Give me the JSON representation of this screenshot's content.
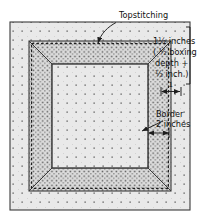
{
  "figure": {
    "title_label": "Topstitching",
    "annotations": {
      "topstitching": "Topstitching",
      "boxing_line1": "1½ inches",
      "boxing_line2": "( ½ boxing",
      "boxing_line3": "depth +",
      "boxing_line4": "½ inch )",
      "dim_small": "1",
      "border_line1": "Border",
      "border_line2": "2 inches"
    },
    "colors": {
      "outline": "#3a3a3a",
      "field_fill": "#e9e9e9",
      "border_band_fill": "#d6d6d6",
      "dot": "#6e6e6e",
      "text": "#111111",
      "background": "#ffffff"
    },
    "geometry": {
      "outer": {
        "x": 10,
        "y": 22,
        "w": 180,
        "h": 188
      },
      "border_outer": {
        "x": 29,
        "y": 41,
        "w": 142,
        "h": 150
      },
      "border_inner": {
        "x": 52,
        "y": 64,
        "w": 96,
        "h": 104
      }
    }
  }
}
